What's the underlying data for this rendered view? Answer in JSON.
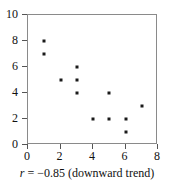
{
  "chart_data": {
    "type": "scatter",
    "title": "",
    "xlabel": "",
    "ylabel": "",
    "xlim": [
      0,
      8
    ],
    "ylim": [
      0,
      10
    ],
    "grid": false,
    "legend": null,
    "x_ticks": [
      "0",
      "2",
      "4",
      "6",
      "8"
    ],
    "x_tick_values": [
      0,
      2,
      4,
      6,
      8
    ],
    "y_ticks": [
      "0",
      "2",
      "4",
      "6",
      "8",
      "10"
    ],
    "y_tick_values": [
      0,
      2,
      4,
      6,
      8,
      10
    ],
    "marker": "square",
    "marker_color": "#1a1a1a",
    "points": [
      {
        "x": 1,
        "y": 8
      },
      {
        "x": 1,
        "y": 7
      },
      {
        "x": 2,
        "y": 5
      },
      {
        "x": 3,
        "y": 6
      },
      {
        "x": 3,
        "y": 5
      },
      {
        "x": 3,
        "y": 4
      },
      {
        "x": 4,
        "y": 2
      },
      {
        "x": 5,
        "y": 4
      },
      {
        "x": 5,
        "y": 2
      },
      {
        "x": 6,
        "y": 2
      },
      {
        "x": 6,
        "y": 1
      },
      {
        "x": 7,
        "y": 3
      }
    ],
    "annotations": {
      "caption_symbol": "r",
      "caption_equals": " = ",
      "caption_value": "−0.85",
      "caption_note": " (downward trend)",
      "caption_full": "r = −0.85 (downward trend)",
      "correlation": -0.85
    }
  },
  "figure": {
    "caption": "r = −0.85 (downward trend)"
  }
}
